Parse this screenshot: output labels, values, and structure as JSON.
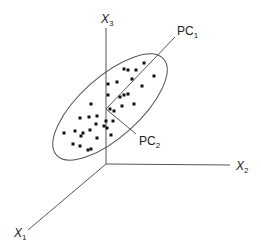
{
  "labels": {
    "x1": "X",
    "x1_sub": "1",
    "x2": "X",
    "x2_sub": "2",
    "x3": "X",
    "x3_sub": "3",
    "pc1": "PC",
    "pc1_sub": "1",
    "pc2": "PC",
    "pc2_sub": "2"
  },
  "colors": {
    "line": "#555555",
    "dot": "#111111"
  },
  "points": [
    [
      144,
      63
    ],
    [
      124,
      69
    ],
    [
      128,
      70
    ],
    [
      136,
      70
    ],
    [
      132,
      79
    ],
    [
      154,
      76
    ],
    [
      108,
      84
    ],
    [
      117,
      82
    ],
    [
      142,
      86
    ],
    [
      108,
      95
    ],
    [
      120,
      97
    ],
    [
      124,
      95
    ],
    [
      128,
      94
    ],
    [
      134,
      104
    ],
    [
      122,
      106
    ],
    [
      91,
      104
    ],
    [
      110,
      109
    ],
    [
      114,
      111
    ],
    [
      80,
      118
    ],
    [
      89,
      117
    ],
    [
      97,
      116
    ],
    [
      96,
      124
    ],
    [
      106,
      121
    ],
    [
      104,
      126
    ],
    [
      107,
      128
    ],
    [
      113,
      121
    ],
    [
      75,
      131
    ],
    [
      64,
      133
    ],
    [
      83,
      133
    ],
    [
      90,
      130
    ],
    [
      81,
      136
    ],
    [
      97,
      138
    ],
    [
      111,
      135
    ],
    [
      73,
      144
    ],
    [
      80,
      146
    ],
    [
      88,
      150
    ],
    [
      91,
      149
    ]
  ]
}
